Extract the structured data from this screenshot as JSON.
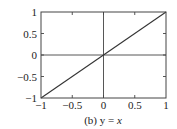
{
  "chart_data": {
    "type": "line",
    "title": "",
    "caption": "(b) y = x",
    "caption_parts": {
      "prefix": "(b) y = ",
      "italic": "x"
    },
    "xlabel": "",
    "ylabel": "",
    "xlim": [
      -1,
      1
    ],
    "ylim": [
      -1,
      1
    ],
    "x_ticks": [
      -1,
      -0.5,
      0,
      0.5,
      1
    ],
    "x_tick_labels": [
      "−1",
      "−0.5",
      "0",
      "0.5",
      "1"
    ],
    "y_ticks": [
      -1,
      -0.5,
      0,
      0.5,
      1
    ],
    "y_tick_labels": [
      "−1",
      "−0.5",
      "0",
      "0.5",
      "1"
    ],
    "grid": false,
    "zero_lines": true,
    "legend": null,
    "series": [
      {
        "name": "y = x",
        "x": [
          -1,
          1
        ],
        "y": [
          -1,
          1
        ],
        "color": "#333333"
      }
    ]
  },
  "style": {
    "axis_color": "#444444",
    "line_color": "#333333",
    "text_color": "#222222"
  }
}
